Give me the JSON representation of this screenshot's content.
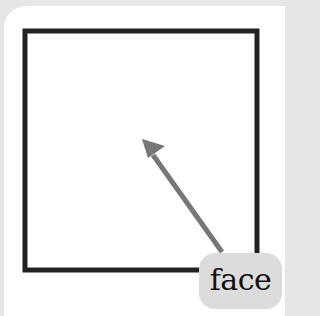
{
  "diagram": {
    "shape": "square",
    "label": "face",
    "colors": {
      "background": "#e6e6e6",
      "panel": "#ffffff",
      "square_stroke": "#222222",
      "arrow": "#777777",
      "label_box": "#dcdcdc"
    }
  }
}
